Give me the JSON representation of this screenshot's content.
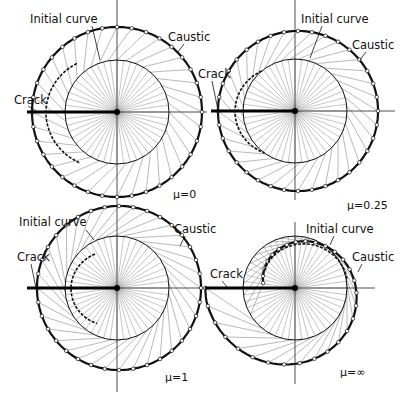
{
  "figure": {
    "colors": {
      "background": "#ffffff",
      "ink": "#111111",
      "ray": "#8a8a8a"
    },
    "panels": [
      {
        "id": "mu-0",
        "mu_label": "μ=0",
        "labels": {
          "initial_curve": "Initial curve",
          "caustic": "Caustic",
          "crack": "Crack"
        },
        "center": [
          117,
          112
        ],
        "inner_radius": 52,
        "caustic_radius": 85,
        "crack_start_x": 27
      },
      {
        "id": "mu-0.25",
        "mu_label": "μ=0.25",
        "labels": {
          "initial_curve": "Initial curve",
          "caustic": "Caustic",
          "crack": "Crack"
        },
        "center": [
          295,
          111
        ],
        "inner_radius": 52,
        "caustic_radius": 80,
        "crack_start_x": 211
      },
      {
        "id": "mu-1",
        "mu_label": "μ=1",
        "labels": {
          "initial_curve": "Initial curve",
          "caustic": "Caustic",
          "crack": "Crack"
        },
        "center": [
          117,
          288
        ],
        "inner_radius": 52,
        "caustic_radius": 82,
        "crack_start_x": 27
      },
      {
        "id": "mu-inf",
        "mu_label": "μ=∞",
        "labels": {
          "initial_curve": "Initial curve",
          "caustic": "Caustic",
          "crack": "Crack"
        },
        "center": [
          295,
          288
        ],
        "inner_radius": 52,
        "caustic_radius": 80,
        "crack_start_x": 205
      }
    ]
  }
}
